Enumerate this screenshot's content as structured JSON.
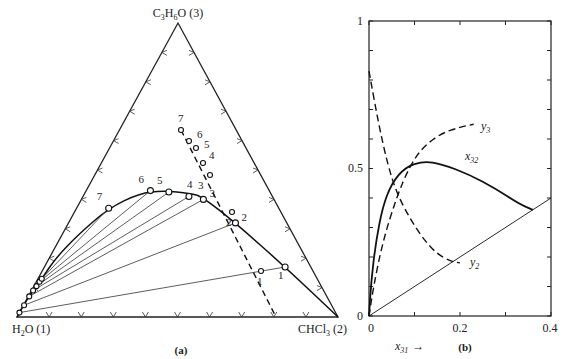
{
  "panel_a": {
    "caption": "(a)",
    "vertices": {
      "top": {
        "formula": "C3H6O",
        "sub": "3",
        "base": "C",
        "mid": "H",
        "sub2": "6",
        "tail": "O",
        "index": "(3)"
      },
      "left": {
        "base": "H",
        "sub": "2",
        "tail": "O",
        "index": "(1)"
      },
      "right": {
        "base": "CHCl",
        "sub": "3",
        "index": "(2)"
      }
    },
    "binodal_points": [
      {
        "x3": 0.0,
        "x2": 0.0
      },
      {
        "x3": 0.025,
        "x2": 0.0
      },
      {
        "x3": 0.06,
        "x2": 0.002
      },
      {
        "x3": 0.085,
        "x2": 0.005
      },
      {
        "x3": 0.1,
        "x2": 0.007
      },
      {
        "x3": 0.115,
        "x2": 0.01
      },
      {
        "x3": 0.13,
        "x2": 0.012
      },
      {
        "x3": 0.2,
        "x2": 0.02
      },
      {
        "x3": 0.28,
        "x2": 0.05
      },
      {
        "x3": 0.37,
        "x2": 0.1
      },
      {
        "x3": 0.42,
        "x2": 0.17
      },
      {
        "x3": 0.43,
        "x2": 0.24
      },
      {
        "x3": 0.42,
        "x2": 0.33
      },
      {
        "x3": 0.41,
        "x2": 0.37
      },
      {
        "x3": 0.32,
        "x2": 0.52
      },
      {
        "x3": 0.17,
        "x2": 0.75
      },
      {
        "x3": 0.0,
        "x2": 1.0
      }
    ],
    "tie_lines": [
      {
        "label": "1",
        "raffinate": {
          "x3": 0.17,
          "x2": 0.75
        },
        "extract": {
          "x3": 0.015,
          "x2": 0.0
        }
      },
      {
        "label": "2",
        "raffinate": {
          "x3": 0.32,
          "x2": 0.52
        },
        "extract": {
          "x3": 0.04,
          "x2": 0.002
        }
      },
      {
        "label": "3",
        "raffinate": {
          "x3": 0.4,
          "x2": 0.38
        },
        "extract": {
          "x3": 0.07,
          "x2": 0.003
        }
      },
      {
        "label": "4",
        "raffinate": {
          "x3": 0.41,
          "x2": 0.33
        },
        "extract": {
          "x3": 0.09,
          "x2": 0.005
        }
      },
      {
        "label": "5",
        "raffinate": {
          "x3": 0.425,
          "x2": 0.26
        },
        "extract": {
          "x3": 0.105,
          "x2": 0.008
        }
      },
      {
        "label": "6",
        "raffinate": {
          "x3": 0.43,
          "x2": 0.2
        },
        "extract": {
          "x3": 0.12,
          "x2": 0.01
        }
      },
      {
        "label": "7",
        "raffinate": {
          "x3": 0.37,
          "x2": 0.1
        },
        "extract": {
          "x3": 0.13,
          "x2": 0.012
        }
      }
    ],
    "conjugate_points": [
      {
        "label": "1",
        "x3": 0.17,
        "x2": 0.54
      },
      {
        "label": "2",
        "x3": 0.29,
        "x2": 0.41
      },
      {
        "label": "3",
        "x3": 0.39,
        "x2": 0.32
      },
      {
        "label": "4",
        "x3": 0.42,
        "x2": 0.28
      },
      {
        "label": "5",
        "x3": 0.47,
        "x2": 0.24
      },
      {
        "label": "6",
        "x3": 0.49,
        "x2": 0.22
      },
      {
        "label": "7",
        "x3": 0.52,
        "x2": 0.2
      }
    ],
    "conjugate_line_end": {
      "x3": 0.0,
      "x2": 0.73
    }
  },
  "panel_b": {
    "caption": "(b)",
    "xlabel": "x",
    "xlabel_sub": "31",
    "xlabel_arrow": "→",
    "x_ticks": [
      "0",
      "0.2",
      "0.4"
    ],
    "y_ticks": [
      "0",
      "0.5",
      "1"
    ],
    "curve_labels": {
      "y3": {
        "base": "y",
        "sub": "3"
      },
      "x32": {
        "base": "x",
        "sub": "32"
      },
      "y2": {
        "base": "y",
        "sub": "2"
      }
    }
  },
  "chart_data": {
    "type": "line",
    "title": "",
    "xlabel": "x31",
    "ylabel": "",
    "xlim": [
      0,
      0.4
    ],
    "ylim": [
      0,
      1
    ],
    "x_ticks": [
      0,
      0.1,
      0.2,
      0.3,
      0.4
    ],
    "y_ticks": [
      0,
      0.1,
      0.2,
      0.3,
      0.4,
      0.5,
      0.6,
      0.7,
      0.8,
      0.9,
      1.0
    ],
    "series": [
      {
        "name": "x32",
        "style": "solid",
        "points": [
          [
            0,
            0
          ],
          [
            0.005,
            0.12
          ],
          [
            0.015,
            0.25
          ],
          [
            0.03,
            0.37
          ],
          [
            0.05,
            0.45
          ],
          [
            0.08,
            0.505
          ],
          [
            0.12,
            0.525
          ],
          [
            0.16,
            0.515
          ],
          [
            0.22,
            0.48
          ],
          [
            0.28,
            0.43
          ],
          [
            0.33,
            0.38
          ],
          [
            0.36,
            0.36
          ]
        ]
      },
      {
        "name": "y3",
        "style": "dashed",
        "points": [
          [
            0,
            0
          ],
          [
            0.01,
            0.1
          ],
          [
            0.03,
            0.25
          ],
          [
            0.06,
            0.4
          ],
          [
            0.09,
            0.51
          ],
          [
            0.12,
            0.575
          ],
          [
            0.16,
            0.62
          ],
          [
            0.2,
            0.64
          ],
          [
            0.23,
            0.65
          ]
        ]
      },
      {
        "name": "y2",
        "style": "dashed",
        "points": [
          [
            0,
            0.83
          ],
          [
            0.02,
            0.66
          ],
          [
            0.04,
            0.52
          ],
          [
            0.06,
            0.42
          ],
          [
            0.09,
            0.33
          ],
          [
            0.12,
            0.26
          ],
          [
            0.15,
            0.21
          ],
          [
            0.18,
            0.185
          ],
          [
            0.2,
            0.18
          ]
        ]
      },
      {
        "name": "diagonal",
        "style": "solid-thin",
        "points": [
          [
            0,
            0
          ],
          [
            0.4,
            0.4
          ]
        ]
      }
    ]
  }
}
